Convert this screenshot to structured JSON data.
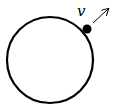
{
  "diagram": {
    "circle": {
      "cx": 50,
      "cy": 60,
      "r": 43,
      "stroke": "#000000"
    },
    "point": {
      "cx": 87,
      "cy": 29,
      "r": 4.5,
      "fill": "#000000"
    },
    "label": {
      "text": "v"
    },
    "arrow": {
      "x1": 93,
      "y1": 23,
      "x2": 108,
      "y2": 9,
      "direction": "outward-tangent"
    }
  }
}
